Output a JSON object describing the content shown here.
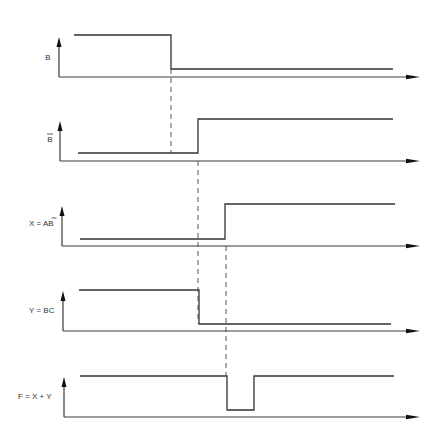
{
  "diagram": {
    "type": "timing-diagram",
    "signals": [
      {
        "id": "B",
        "label": "B",
        "overbar": false,
        "axis_y": 77,
        "high_y": 35,
        "low_y": 69,
        "axis_x": 59,
        "start_x": 74,
        "end_x": 393,
        "segments": [
          {
            "from": 74,
            "to": 171,
            "level": "high"
          },
          {
            "from": 171,
            "to": 393,
            "level": "low"
          }
        ]
      },
      {
        "id": "B_bar",
        "label": "B",
        "overbar": true,
        "axis_y": 161,
        "high_y": 119,
        "low_y": 153,
        "axis_x": 60,
        "start_x": 78,
        "end_x": 393,
        "segments": [
          {
            "from": 78,
            "to": 198,
            "level": "low"
          },
          {
            "from": 198,
            "to": 393,
            "level": "high"
          }
        ]
      },
      {
        "id": "X",
        "label": "X = AB",
        "overbar_on_last": true,
        "axis_y": 246,
        "high_y": 204,
        "low_y": 239,
        "axis_x": 62,
        "start_x": 80,
        "end_x": 395,
        "segments": [
          {
            "from": 80,
            "to": 225,
            "level": "low"
          },
          {
            "from": 225,
            "to": 395,
            "level": "high"
          }
        ]
      },
      {
        "id": "Y",
        "label": "Y = BC",
        "axis_y": 331,
        "high_y": 290,
        "low_y": 324,
        "axis_x": 63,
        "start_x": 79,
        "end_x": 391,
        "segments": [
          {
            "from": 79,
            "to": 199,
            "level": "high"
          },
          {
            "from": 199,
            "to": 391,
            "level": "low"
          }
        ]
      },
      {
        "id": "F",
        "label": "F = X + Y",
        "axis_y": 417,
        "high_y": 376,
        "low_y": 410,
        "axis_x": 64,
        "start_x": 80,
        "end_x": 394,
        "segments": [
          {
            "from": 80,
            "to": 227,
            "level": "high"
          },
          {
            "from": 227,
            "to": 254,
            "level": "low"
          },
          {
            "from": 254,
            "to": 394,
            "level": "high"
          }
        ]
      }
    ],
    "guides": [
      {
        "x": 171,
        "from_signal": "B",
        "to_signal": "B_bar",
        "y1": 69,
        "y2": 153
      },
      {
        "x": 198,
        "from_signal": "B_bar",
        "to_signal": "Y",
        "y1": 161,
        "y2": 324
      },
      {
        "x": 226,
        "from_signal": "X",
        "to_signal": "F",
        "y1": 246,
        "y2": 376
      }
    ],
    "axis_arrow_end_x": 420,
    "axis_top_offset": 40
  },
  "labels": {
    "b": "B",
    "b_bar": "B",
    "x": "X = AB",
    "y": "Y = BC",
    "f": "F = X + Y"
  }
}
